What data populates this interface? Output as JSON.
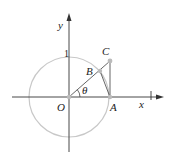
{
  "diagram": {
    "type": "unit-circle-geometry",
    "labels": {
      "y_axis": "y",
      "x_axis": "x",
      "origin": "O",
      "point_A": "A",
      "point_B": "B",
      "point_C": "C",
      "angle": "θ",
      "unit_mark": "1"
    },
    "colors": {
      "axes": "#333333",
      "circle": "#c8c8c8",
      "lines": "#555555",
      "points": "#bbbbbb"
    },
    "geometry": {
      "origin": [
        69,
        97
      ],
      "radius": 40,
      "A": [
        109,
        97
      ],
      "B": [
        100,
        71
      ],
      "C": [
        110,
        61
      ]
    }
  }
}
